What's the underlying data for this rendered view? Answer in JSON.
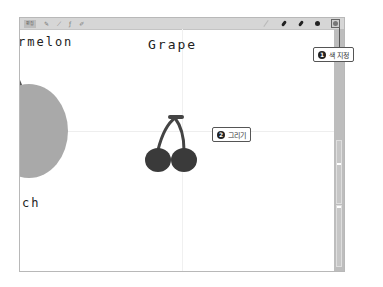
{
  "toolbar": {
    "left_items": [
      {
        "name": "edit-mode-button",
        "label": "편집"
      },
      {
        "name": "select-tool",
        "icon": "✎"
      },
      {
        "name": "lasso-tool",
        "icon": "⟋"
      },
      {
        "name": "text-tool",
        "icon": "ƒ"
      },
      {
        "name": "eraser-tool",
        "icon": "✐"
      }
    ],
    "right_items": [
      {
        "name": "pencil-tool"
      },
      {
        "name": "pen-tool"
      },
      {
        "name": "marker-tool"
      },
      {
        "name": "brush-tool"
      },
      {
        "name": "color-picker"
      }
    ]
  },
  "canvas": {
    "labels": {
      "watermelon": "rmelon",
      "grape": "Grape",
      "peach": "ch"
    }
  },
  "callouts": [
    {
      "number": "1",
      "text": "색 지정"
    },
    {
      "number": "2",
      "text": "그리기"
    }
  ],
  "colors": {
    "toolbar_bg": "#d6d6d6",
    "side_panel": "#bdbdbd",
    "peach_fill": "#a9a9a9",
    "cherry_fill": "#3a3a3a",
    "frame_border": "#b8b8b8"
  }
}
